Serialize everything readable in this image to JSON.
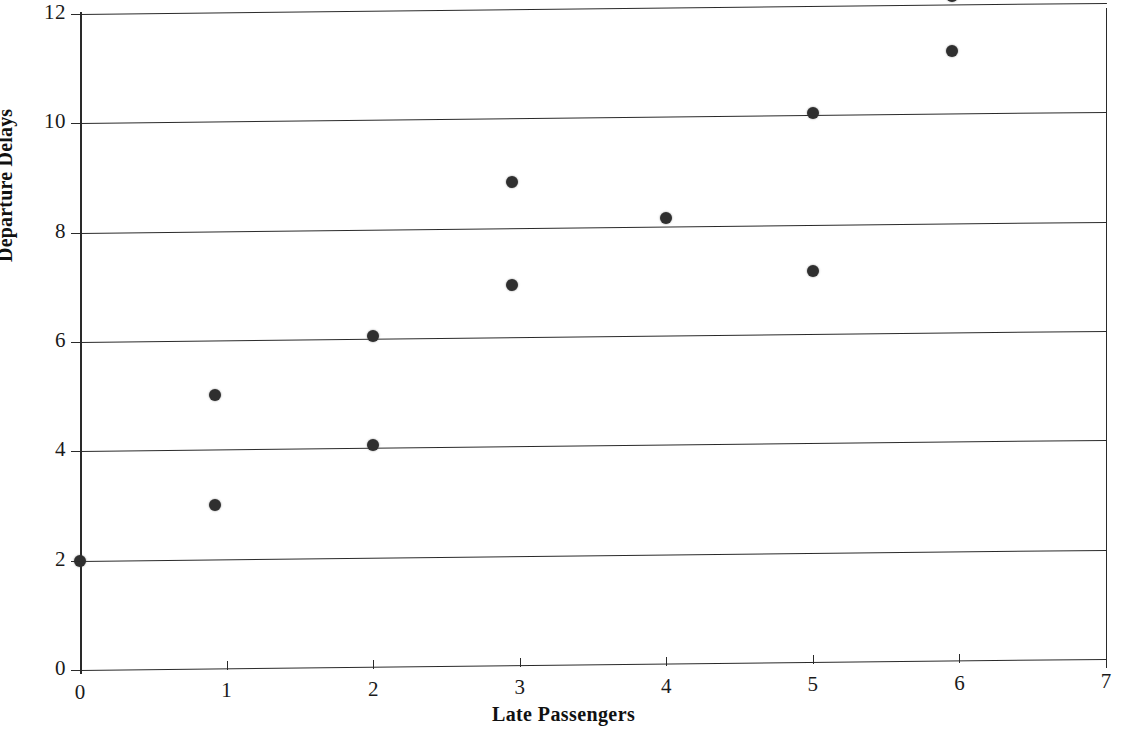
{
  "chart_data": {
    "type": "scatter",
    "title": "",
    "xlabel": "Late Passengers",
    "ylabel": "Departure Delays",
    "xlim": [
      0,
      7
    ],
    "ylim": [
      0,
      12
    ],
    "xticks": [
      0,
      1,
      2,
      3,
      4,
      5,
      6,
      7
    ],
    "xtick_labels": [
      "0",
      "1",
      "2",
      "3",
      "4",
      "5",
      "6",
      "7"
    ],
    "yticks": [
      0,
      2,
      4,
      6,
      8,
      10,
      12
    ],
    "ytick_labels": [
      "0",
      "2",
      "4",
      "6",
      "8",
      "10",
      "12"
    ],
    "grid": "horizontal",
    "legend": "none",
    "marker_color": "#2f2f2f",
    "axis_color": "#2a2a2a",
    "background_color": "#ffffff",
    "points": [
      {
        "x": 0,
        "y": 2.0
      },
      {
        "x": 0.92,
        "y": 5.0
      },
      {
        "x": 0.92,
        "y": 3.0
      },
      {
        "x": 2.0,
        "y": 6.05
      },
      {
        "x": 2.0,
        "y": 4.05
      },
      {
        "x": 2.95,
        "y": 8.85
      },
      {
        "x": 2.95,
        "y": 6.95
      },
      {
        "x": 4.0,
        "y": 8.15
      },
      {
        "x": 5.0,
        "y": 10.05
      },
      {
        "x": 5.0,
        "y": 7.15
      },
      {
        "x": 5.95,
        "y": 12.15
      },
      {
        "x": 5.95,
        "y": 11.15
      }
    ]
  }
}
